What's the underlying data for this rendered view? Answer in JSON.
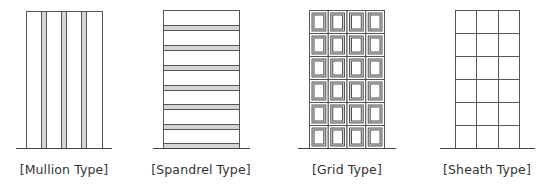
{
  "figure": {
    "panels": [
      {
        "id": "mullion",
        "label": "[Mullion Type]",
        "center_x": 64
      },
      {
        "id": "spandrel",
        "label": "[Spandrel Type]",
        "center_x": 201
      },
      {
        "id": "grid",
        "label": "[Grid Type]",
        "center_x": 347
      },
      {
        "id": "sheath",
        "label": "[Sheath Type]",
        "center_x": 487
      }
    ]
  },
  "colors": {
    "line": "#555555",
    "fill": "#d4d4d4",
    "ground": "#444444",
    "background": "#ffffff"
  }
}
